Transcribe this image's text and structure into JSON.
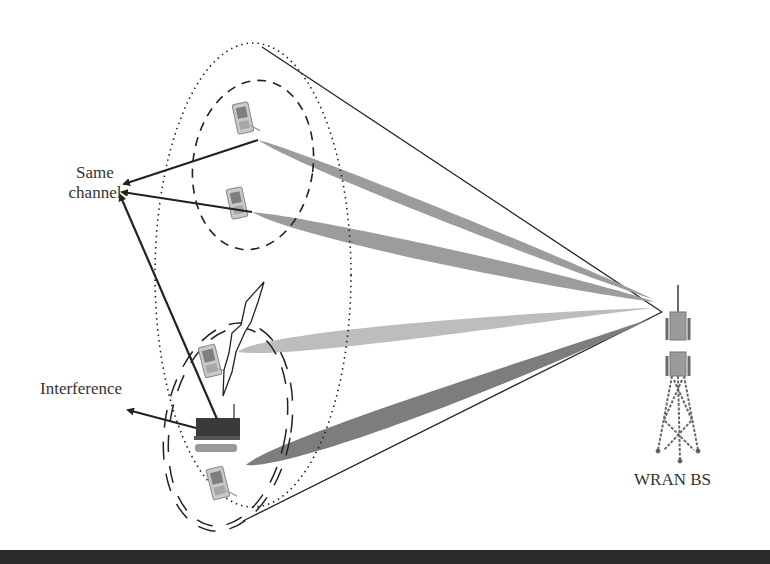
{
  "diagram": {
    "labels": {
      "same_channel_line1": "Same",
      "same_channel_line2": "channel",
      "interference": "Interference",
      "base_station": "WRAN BS"
    },
    "nodes": [
      {
        "id": "cpe-1",
        "type": "handset",
        "group": "upper-cluster"
      },
      {
        "id": "cpe-2",
        "type": "handset",
        "group": "upper-cluster"
      },
      {
        "id": "cpe-3",
        "type": "handset",
        "group": "lower-cluster"
      },
      {
        "id": "interferer",
        "type": "router-device",
        "group": "lower-cluster"
      },
      {
        "id": "cpe-4",
        "type": "handset",
        "group": "lower-cluster"
      },
      {
        "id": "wran-bs",
        "type": "tower"
      }
    ],
    "regions": [
      {
        "id": "cell-boundary",
        "style": "dotted ellipse"
      },
      {
        "id": "upper-cluster",
        "style": "dashed ellipse"
      },
      {
        "id": "lower-cluster",
        "style": "double-dashed ellipse"
      }
    ],
    "edges": [
      {
        "from": "wran-bs",
        "to": "cpe-1",
        "type": "beam"
      },
      {
        "from": "wran-bs",
        "to": "cpe-2",
        "type": "beam"
      },
      {
        "from": "wran-bs",
        "to": "cpe-3",
        "type": "beam"
      },
      {
        "from": "wran-bs",
        "to": "cpe-4",
        "type": "beam"
      },
      {
        "from": "interferer",
        "to": "cpe-3",
        "type": "interference-bolt"
      },
      {
        "from": "cpe-1",
        "to": "same-channel-label",
        "type": "arrow"
      },
      {
        "from": "cpe-2",
        "to": "same-channel-label",
        "type": "arrow"
      },
      {
        "from": "interferer",
        "to": "same-channel-label",
        "type": "arrow"
      },
      {
        "from": "interferer",
        "to": "interference-label",
        "type": "arrow"
      }
    ],
    "colors": {
      "beam_light": "#bdbdbd",
      "beam_mid": "#9a9a9a",
      "beam_dark": "#7a7a7a",
      "line": "#222222",
      "text": "#333333"
    }
  }
}
